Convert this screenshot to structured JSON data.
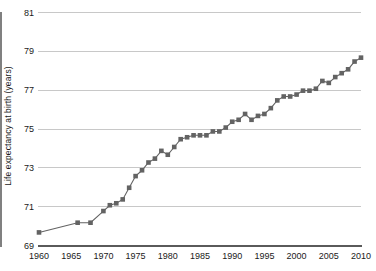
{
  "chart_data": {
    "type": "line",
    "title": "",
    "subtitle": "",
    "xlabel": "",
    "ylabel": "Life expectancy at birth (years)",
    "xlim": [
      1960,
      2010
    ],
    "ylim": [
      69,
      81
    ],
    "ytick_labels": [
      "69",
      "71",
      "73",
      "75",
      "77",
      "79",
      "81"
    ],
    "ytick_values": [
      69,
      71,
      73,
      75,
      77,
      79,
      81
    ],
    "xtick_labels": [
      "1960",
      "1965",
      "1970",
      "1975",
      "1980",
      "1985",
      "1990",
      "1995",
      "2000",
      "2005",
      "2010"
    ],
    "xtick_values": [
      1960,
      1965,
      1970,
      1975,
      1980,
      1985,
      1990,
      1995,
      2000,
      2005,
      2010
    ],
    "grid": "horizontal",
    "legend": "none",
    "marker": "square",
    "series_color": "#636363",
    "gridline_color": "#c8c8c8",
    "axis_color": "#808080",
    "background_color": "#ffffff",
    "series": [
      {
        "name": "Life expectancy at birth",
        "x": [
          1960,
          1966,
          1968,
          1970,
          1971,
          1972,
          1973,
          1974,
          1975,
          1976,
          1977,
          1978,
          1979,
          1980,
          1981,
          1982,
          1983,
          1984,
          1985,
          1986,
          1987,
          1988,
          1989,
          1990,
          1991,
          1992,
          1993,
          1994,
          1995,
          1996,
          1997,
          1998,
          1999,
          2000,
          2001,
          2002,
          2003,
          2004,
          2005,
          2006,
          2007,
          2008,
          2009,
          2010
        ],
        "values": [
          69.7,
          70.2,
          70.2,
          70.8,
          71.1,
          71.2,
          71.4,
          72.0,
          72.6,
          72.9,
          73.3,
          73.5,
          73.9,
          73.7,
          74.1,
          74.5,
          74.6,
          74.7,
          74.7,
          74.7,
          74.9,
          74.9,
          75.1,
          75.4,
          75.5,
          75.8,
          75.5,
          75.7,
          75.8,
          76.1,
          76.5,
          76.7,
          76.7,
          76.8,
          77.0,
          77.0,
          77.1,
          77.5,
          77.4,
          77.7,
          77.9,
          78.1,
          78.5,
          78.7
        ]
      }
    ]
  },
  "axis": {
    "y_title": "Life expectancy at birth (years)"
  }
}
